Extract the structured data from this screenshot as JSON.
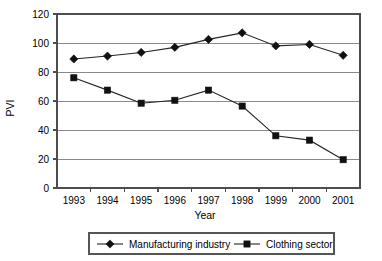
{
  "chart_data": {
    "type": "line",
    "title": "",
    "xlabel": "Year",
    "ylabel": "PVI",
    "categories": [
      "1993",
      "1994",
      "1995",
      "1996",
      "1997",
      "1998",
      "1999",
      "2000",
      "2001"
    ],
    "x": [
      1993,
      1994,
      1995,
      1996,
      1997,
      1998,
      1999,
      2000,
      2001
    ],
    "series": [
      {
        "name": "Manufacturing industry",
        "marker": "diamond",
        "values": [
          89,
          91,
          93.5,
          97,
          102.5,
          107,
          98,
          99,
          91.5
        ]
      },
      {
        "name": "Clothing sector",
        "marker": "square",
        "values": [
          76,
          67.5,
          58.5,
          60.5,
          67.5,
          56.5,
          36,
          33,
          19.5
        ]
      }
    ],
    "ylim": [
      0,
      120
    ],
    "yticks": [
      0,
      20,
      40,
      60,
      80,
      100,
      120
    ],
    "ytick_labels": [
      "0",
      "20",
      "40",
      "60",
      "80",
      "100",
      "120"
    ],
    "grid": true,
    "grid_axis": "y",
    "legend_position": "bottom",
    "colors": {
      "series_line": "#262626",
      "marker": "#111111",
      "gridline": "#8a8a8a",
      "frame": "#4d4d4d",
      "background": "#ffffff"
    }
  },
  "axes": {
    "y_title": "PVI",
    "x_title": "Year",
    "y_ticks": [
      "120",
      "100",
      "80",
      "60",
      "40",
      "20",
      "0"
    ],
    "x_ticks": [
      "1993",
      "1994",
      "1995",
      "1996",
      "1997",
      "1998",
      "1999",
      "2000",
      "2001"
    ]
  },
  "legend": {
    "entries": [
      {
        "label": "Manufacturing industry",
        "marker": "diamond"
      },
      {
        "label": "Clothing sector",
        "marker": "square"
      }
    ]
  }
}
